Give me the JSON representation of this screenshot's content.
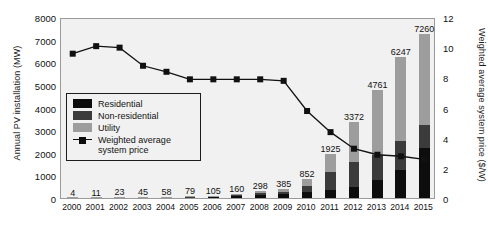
{
  "chart_data": {
    "type": "bar",
    "title": "",
    "subtitle": "",
    "xlabel": "",
    "ylabel": "Annual PV installation (MW)",
    "y2label": "Weighted average system price ($/W)",
    "grid": false,
    "legend_position": "inside-left",
    "categories": [
      "2000",
      "2001",
      "2002",
      "2003",
      "2004",
      "2005",
      "2006",
      "2007",
      "2008",
      "2009",
      "2010",
      "2011",
      "2012",
      "2013",
      "2014",
      "2015"
    ],
    "ylim": [
      0,
      8000
    ],
    "yticks": [
      0,
      1000,
      2000,
      3000,
      4000,
      5000,
      6000,
      7000,
      8000
    ],
    "y2lim": [
      0,
      12
    ],
    "y2ticks": [
      0,
      2,
      4,
      6,
      8,
      10,
      12
    ],
    "series": [
      {
        "name": "Residential",
        "type": "bar-stack",
        "color": "#0d0d0d",
        "values": [
          2,
          5,
          10,
          19,
          24,
          33,
          44,
          67,
          125,
          161,
          285,
          350,
          488,
          790,
          1230,
          2200
        ]
      },
      {
        "name": "Non-residential",
        "type": "bar-stack",
        "color": "#3b3b3b",
        "values": [
          1,
          3,
          7,
          14,
          18,
          25,
          33,
          52,
          97,
          125,
          252,
          805,
          1105,
          1110,
          1300,
          1030
        ]
      },
      {
        "name": "Utility",
        "type": "bar-stack",
        "color": "#9d9d9d",
        "values": [
          1,
          3,
          6,
          12,
          16,
          21,
          28,
          41,
          76,
          99,
          315,
          770,
          1779,
          2861,
          3717,
          4030
        ]
      },
      {
        "name": "Weighted average system price",
        "type": "line",
        "color": "#111111",
        "axis": "right",
        "values": [
          9.7,
          10.2,
          10.1,
          8.9,
          8.5,
          8.0,
          8.0,
          8.0,
          8.0,
          7.9,
          5.9,
          4.5,
          3.4,
          3.0,
          2.9,
          2.7
        ]
      }
    ],
    "bar_totals": [
      4,
      11,
      23,
      45,
      58,
      79,
      105,
      160,
      298,
      385,
      852,
      1925,
      3372,
      4761,
      6247,
      7260
    ],
    "bar_total_labels": [
      "4",
      "11",
      "23",
      "45",
      "58",
      "79",
      "105",
      "160",
      "298",
      "385",
      "852",
      "1925",
      "3372",
      "4761",
      "6247",
      "7260"
    ]
  },
  "legend": {
    "items": [
      {
        "label": "Residential",
        "swatch": "sw-res"
      },
      {
        "label": "Non-residential",
        "swatch": "sw-non"
      },
      {
        "label": "Utility",
        "swatch": "sw-util"
      },
      {
        "label": "Weighted average system price",
        "swatch": "sw-line"
      }
    ]
  },
  "colors": {
    "residential": "#0d0d0d",
    "non_residential": "#3b3b3b",
    "utility": "#9d9d9d",
    "line": "#111111",
    "plot_background": "#f1f1f1",
    "plot_border": "#9a9a9a"
  }
}
